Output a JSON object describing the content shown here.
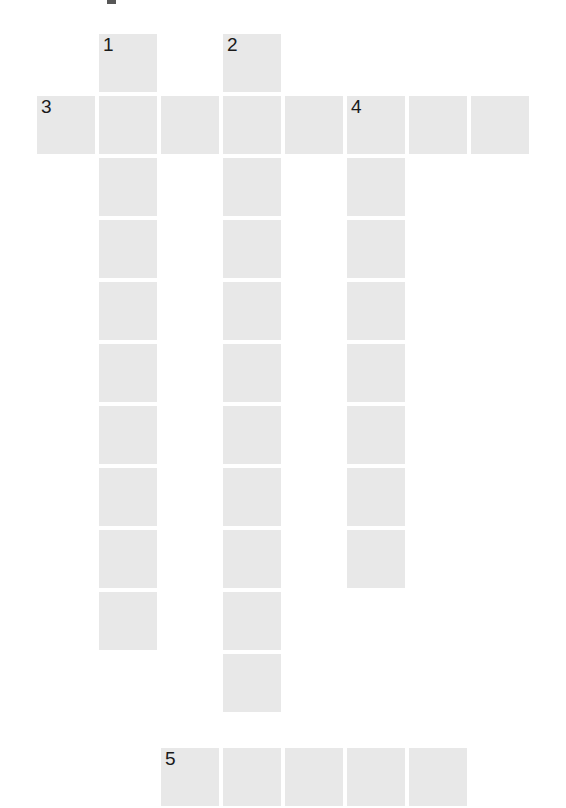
{
  "puzzle": {
    "kind": "crossword-grid",
    "width": 566,
    "height": 808,
    "cell_size": 58,
    "cell_pitch": 61.8,
    "cell_color": "#e8e8e8",
    "background_color": "#ffffff",
    "number_color": "#1a1a1a",
    "column_origins_x": [
      37,
      99,
      161,
      223,
      285,
      347,
      409,
      471
    ],
    "row_origins_y": [
      34,
      96,
      158,
      220,
      282,
      344,
      406,
      468,
      530,
      592,
      654,
      716,
      748
    ],
    "clue_numbers": [
      {
        "label": "1",
        "col": 1,
        "row": 0,
        "direction": "down",
        "length": 11
      },
      {
        "label": "2",
        "col": 3,
        "row": 0,
        "direction": "down",
        "length": 12
      },
      {
        "label": "3",
        "col": 0,
        "row": 1,
        "direction": "across",
        "length": 8
      },
      {
        "label": "4",
        "col": 5,
        "row": 1,
        "direction": "down",
        "length": 8
      },
      {
        "label": "5",
        "col": 2,
        "row": 12,
        "direction": "across",
        "length": 5
      }
    ],
    "cells": [
      {
        "col": 1,
        "row": 0,
        "number": "1"
      },
      {
        "col": 3,
        "row": 0,
        "number": "2"
      },
      {
        "col": 0,
        "row": 1,
        "number": "3"
      },
      {
        "col": 1,
        "row": 1,
        "number": ""
      },
      {
        "col": 2,
        "row": 1,
        "number": ""
      },
      {
        "col": 3,
        "row": 1,
        "number": ""
      },
      {
        "col": 4,
        "row": 1,
        "number": ""
      },
      {
        "col": 5,
        "row": 1,
        "number": "4"
      },
      {
        "col": 6,
        "row": 1,
        "number": ""
      },
      {
        "col": 7,
        "row": 1,
        "number": ""
      },
      {
        "col": 1,
        "row": 2,
        "number": ""
      },
      {
        "col": 3,
        "row": 2,
        "number": ""
      },
      {
        "col": 5,
        "row": 2,
        "number": ""
      },
      {
        "col": 1,
        "row": 3,
        "number": ""
      },
      {
        "col": 3,
        "row": 3,
        "number": ""
      },
      {
        "col": 5,
        "row": 3,
        "number": ""
      },
      {
        "col": 1,
        "row": 4,
        "number": ""
      },
      {
        "col": 3,
        "row": 4,
        "number": ""
      },
      {
        "col": 5,
        "row": 4,
        "number": ""
      },
      {
        "col": 1,
        "row": 5,
        "number": ""
      },
      {
        "col": 3,
        "row": 5,
        "number": ""
      },
      {
        "col": 5,
        "row": 5,
        "number": ""
      },
      {
        "col": 1,
        "row": 6,
        "number": ""
      },
      {
        "col": 3,
        "row": 6,
        "number": ""
      },
      {
        "col": 5,
        "row": 6,
        "number": ""
      },
      {
        "col": 1,
        "row": 7,
        "number": ""
      },
      {
        "col": 3,
        "row": 7,
        "number": ""
      },
      {
        "col": 5,
        "row": 7,
        "number": ""
      },
      {
        "col": 1,
        "row": 8,
        "number": ""
      },
      {
        "col": 3,
        "row": 8,
        "number": ""
      },
      {
        "col": 5,
        "row": 8,
        "number": ""
      },
      {
        "col": 1,
        "row": 9,
        "number": ""
      },
      {
        "col": 3,
        "row": 9,
        "number": ""
      },
      {
        "col": 3,
        "row": 10,
        "number": ""
      },
      {
        "col": 2,
        "row": 12,
        "number": "5"
      },
      {
        "col": 3,
        "row": 12,
        "number": ""
      },
      {
        "col": 4,
        "row": 12,
        "number": ""
      },
      {
        "col": 5,
        "row": 12,
        "number": ""
      },
      {
        "col": 6,
        "row": 12,
        "number": ""
      }
    ]
  }
}
